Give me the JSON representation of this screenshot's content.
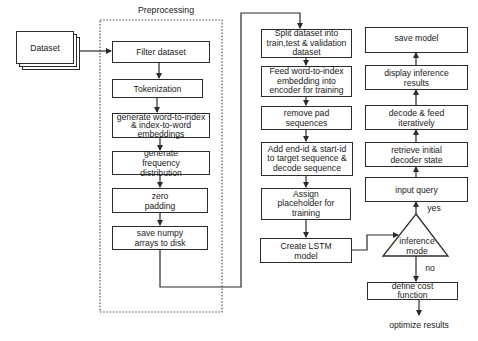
{
  "diagram": {
    "type": "flowchart",
    "input": {
      "label": "Dataset"
    },
    "preprocessing": {
      "title": "Preprocessing",
      "steps": [
        "Filter dataset",
        "Tokenization",
        "generate word-to-index & index-to-word embeddings",
        "generate frequency distribution",
        "zero padding",
        "save numpy arrays to disk"
      ]
    },
    "training": {
      "steps": [
        "Split dataset into train,test & validation dataset",
        "Feed word-to-index embedding into encoder for training",
        "remove pad sequences",
        "Add end-id & start-id to target sequence & decode sequence",
        "Assign placeholder for training",
        "Create LSTM model"
      ]
    },
    "decision": {
      "label": "inference mode",
      "yes_label": "yes",
      "no_label": "no"
    },
    "inference": {
      "steps": [
        "input query",
        "retrieve initial decoder state",
        "decode & feed iteratively",
        "display inference results",
        "save model"
      ]
    },
    "no_branch": {
      "steps": [
        "define cost function"
      ],
      "end": "optimize results"
    },
    "colors": {
      "stroke": "#2b2b2b",
      "background": "#ffffff",
      "text": "#1a1a1a"
    }
  }
}
